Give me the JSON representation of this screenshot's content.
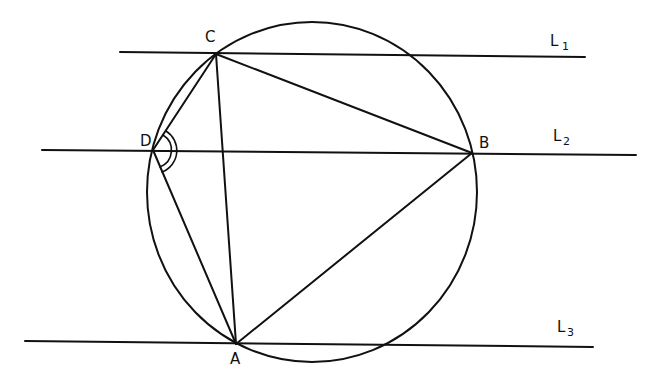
{
  "diagram": {
    "type": "geometry",
    "points": {
      "A": {
        "label": "A",
        "x": 236,
        "y": 344
      },
      "B": {
        "label": "B",
        "x": 472,
        "y": 153
      },
      "C": {
        "label": "C",
        "x": 216,
        "y": 54
      },
      "D": {
        "label": "D",
        "x": 153,
        "y": 150
      }
    },
    "lines": [
      {
        "name": "L",
        "sub": "1",
        "x1": 120,
        "y1": 52,
        "x2": 585,
        "y2": 57
      },
      {
        "name": "L",
        "sub": "2",
        "x1": 42,
        "y1": 150,
        "x2": 636,
        "y2": 155
      },
      {
        "name": "L",
        "sub": "3",
        "x1": 25,
        "y1": 341,
        "x2": 593,
        "y2": 347
      }
    ],
    "circle": {
      "cx": 312,
      "cy": 192,
      "rx": 165,
      "ry": 170
    },
    "segments": [
      "CB",
      "BA",
      "AC",
      "CD",
      "DA"
    ],
    "angle_mark": {
      "vertex": "D",
      "between": [
        "DC",
        "DA"
      ],
      "arcs": 2
    }
  }
}
